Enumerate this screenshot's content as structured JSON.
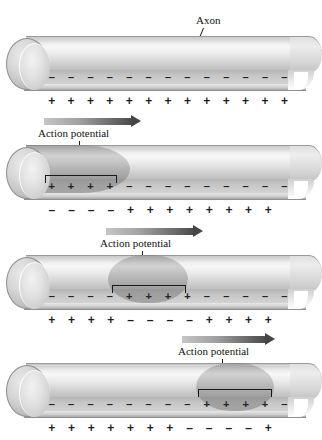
{
  "figure": {
    "type": "diagram",
    "background_color": "#ffffff",
    "symbols": {
      "positive": "+",
      "negative": "–"
    }
  },
  "labels": {
    "axon": "Axon",
    "action_potential": "Action potential"
  },
  "panels": [
    {
      "id": "panel-1-resting",
      "state": "resting",
      "has_action_potential": false,
      "inside_charges": [
        "–",
        "–",
        "–",
        "–",
        "–",
        "–",
        "–",
        "–",
        "–",
        "–",
        "–",
        "–",
        "–"
      ],
      "outside_charges": [
        "+",
        "+",
        "+",
        "+",
        "+",
        "+",
        "+",
        "+",
        "+",
        "+",
        "+",
        "+",
        "+"
      ],
      "depolarized_start_pct": null,
      "depolarized_width_pct": null
    },
    {
      "id": "panel-2-initiation",
      "state": "action potential at proximal end",
      "has_action_potential": true,
      "inside_charges": [
        "+",
        "+",
        "+",
        "+",
        "–",
        "–",
        "–",
        "–",
        "–",
        "–",
        "–",
        "–",
        "–"
      ],
      "outside_charges": [
        "–",
        "–",
        "–",
        "–",
        "+",
        "+",
        "+",
        "+",
        "+",
        "+",
        "+",
        "+"
      ],
      "depolarized_start_pct": 0,
      "depolarized_width_pct": 36
    },
    {
      "id": "panel-3-midway",
      "state": "action potential at middle of axon",
      "has_action_potential": true,
      "inside_charges": [
        "–",
        "–",
        "–",
        "–",
        "+",
        "+",
        "+",
        "+",
        "–",
        "–",
        "–",
        "–",
        "–"
      ],
      "outside_charges": [
        "+",
        "+",
        "+",
        "+",
        "–",
        "–",
        "–",
        "–",
        "+",
        "+",
        "+",
        "+"
      ],
      "depolarized_start_pct": 30,
      "depolarized_width_pct": 36
    },
    {
      "id": "panel-4-distal",
      "state": "action potential near distal end",
      "has_action_potential": true,
      "inside_charges": [
        "–",
        "–",
        "–",
        "–",
        "–",
        "–",
        "–",
        "–",
        "+",
        "+",
        "+",
        "+",
        "–"
      ],
      "outside_charges": [
        "+",
        "+",
        "+",
        "+",
        "+",
        "+",
        "+",
        "–",
        "–",
        "–",
        "–",
        "+"
      ],
      "depolarized_start_pct": 60,
      "depolarized_width_pct": 34
    }
  ]
}
